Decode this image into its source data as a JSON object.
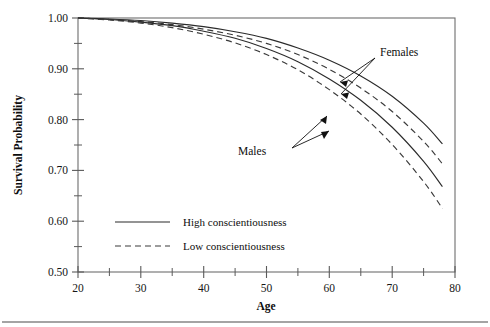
{
  "chart_data": {
    "type": "line",
    "title": "",
    "xlabel": "Age",
    "ylabel": "Survival Probability",
    "xlim": [
      20,
      80
    ],
    "ylim": [
      0.5,
      1.0
    ],
    "xticks": [
      20,
      30,
      40,
      50,
      60,
      70,
      80
    ],
    "xticklabels": [
      "20",
      "30",
      "40",
      "50",
      "60",
      "70",
      "80"
    ],
    "xminorticks": [
      25,
      35,
      45,
      55,
      65,
      75
    ],
    "yticks": [
      0.5,
      0.6,
      0.7,
      0.8,
      0.9,
      1.0
    ],
    "yticklabels": [
      "0.50",
      "0.60",
      "0.70",
      "0.80",
      "0.90",
      "1.00"
    ],
    "yminorticks": [
      0.55,
      0.65,
      0.75,
      0.85,
      0.95
    ],
    "grid": false,
    "legend_position": "lower-left-inside",
    "x": [
      20,
      25,
      30,
      35,
      40,
      45,
      50,
      55,
      60,
      65,
      70,
      75,
      78
    ],
    "series": [
      {
        "name": "Females, High conscientiousness",
        "group": "Females",
        "style": "solid",
        "values": [
          1.0,
          0.998,
          0.995,
          0.99,
          0.983,
          0.973,
          0.96,
          0.941,
          0.917,
          0.886,
          0.846,
          0.793,
          0.752
        ]
      },
      {
        "name": "Females, Low conscientiousness",
        "group": "Females",
        "style": "dashed",
        "values": [
          1.0,
          0.997,
          0.993,
          0.987,
          0.978,
          0.966,
          0.95,
          0.928,
          0.899,
          0.862,
          0.816,
          0.757,
          0.713
        ]
      },
      {
        "name": "Males, High conscientiousness",
        "group": "Males",
        "style": "solid",
        "values": [
          1.0,
          0.997,
          0.992,
          0.985,
          0.974,
          0.96,
          0.94,
          0.914,
          0.88,
          0.838,
          0.785,
          0.718,
          0.668
        ]
      },
      {
        "name": "Males, Low conscientiousness",
        "group": "Males",
        "style": "dashed",
        "values": [
          1.0,
          0.996,
          0.99,
          0.981,
          0.968,
          0.951,
          0.928,
          0.898,
          0.859,
          0.811,
          0.751,
          0.678,
          0.625
        ]
      }
    ],
    "annotations": [
      {
        "text": "Females",
        "points_to": [
          "Females, High conscientiousness",
          "Females, Low conscientiousness"
        ]
      },
      {
        "text": "Males",
        "points_to": [
          "Males, High conscientiousness",
          "Males, Low conscientiousness"
        ]
      }
    ],
    "legend": [
      {
        "label": "High conscientiousness",
        "style": "solid"
      },
      {
        "label": "Low conscientiousness",
        "style": "dashed"
      }
    ]
  },
  "axes": {
    "y_title": "Survival Probability",
    "x_title": "Age"
  },
  "annotations": {
    "females": "Females",
    "males": "Males"
  },
  "legend": {
    "high": "High conscientiousness",
    "low": "Low conscientiousness"
  },
  "yticklabels": [
    "1.00",
    "0.90",
    "0.80",
    "0.70",
    "0.60",
    "0.50"
  ],
  "xticklabels": [
    "20",
    "30",
    "40",
    "50",
    "60",
    "70",
    "80"
  ],
  "colors": {
    "line": "#2b2b2b",
    "axis": "#6d6d6d",
    "text": "#0d0d0d",
    "background": "#ffffff"
  }
}
